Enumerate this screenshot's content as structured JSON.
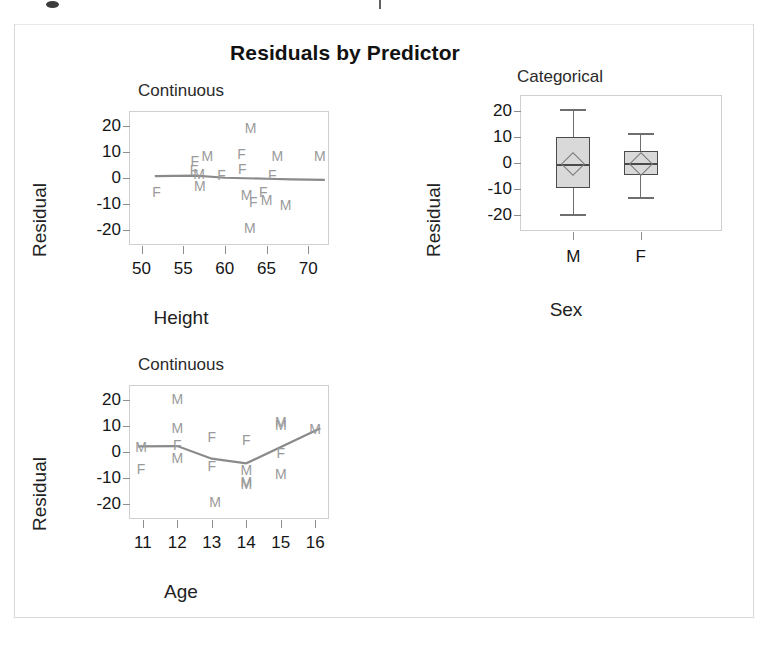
{
  "figure": {
    "title": "Residuals by Predictor",
    "background_color": "#ffffff",
    "frame_color": "#d8d8d8",
    "point_color": "#9a9a9a",
    "line_color": "#8a8a8a",
    "box_fill_color": "#d9d9d9",
    "box_border_color": "#4a4a4a"
  },
  "chart_data": [
    {
      "type": "scatter",
      "panel_index": 0,
      "title": "Continuous",
      "xlabel": "Height",
      "ylabel": "Residual",
      "xlim": [
        48.5,
        72.5
      ],
      "ylim": [
        -26,
        26
      ],
      "xticks": [
        50,
        55,
        60,
        65,
        70
      ],
      "yticks": [
        20,
        10,
        0,
        -10,
        -20
      ],
      "grid": false,
      "legend": "none",
      "point_labels": [
        "M",
        "F"
      ],
      "points": [
        {
          "x": 51.8,
          "y": -5.5,
          "label": "F"
        },
        {
          "x": 56.4,
          "y": 6.5,
          "label": "F"
        },
        {
          "x": 56.3,
          "y": 3.0,
          "label": "F"
        },
        {
          "x": 56.9,
          "y": 1.5,
          "label": "M"
        },
        {
          "x": 57.0,
          "y": -3.0,
          "label": "M"
        },
        {
          "x": 57.9,
          "y": 8.5,
          "label": "M"
        },
        {
          "x": 59.6,
          "y": 1.0,
          "label": "F"
        },
        {
          "x": 62.0,
          "y": 9.5,
          "label": "F"
        },
        {
          "x": 62.1,
          "y": 3.5,
          "label": "F"
        },
        {
          "x": 63.1,
          "y": 19.5,
          "label": "M"
        },
        {
          "x": 62.6,
          "y": -6.5,
          "label": "M"
        },
        {
          "x": 63.4,
          "y": -9.5,
          "label": "F"
        },
        {
          "x": 63.0,
          "y": -19.5,
          "label": "M"
        },
        {
          "x": 64.6,
          "y": -5.5,
          "label": "F"
        },
        {
          "x": 65.7,
          "y": 1.0,
          "label": "F"
        },
        {
          "x": 65.0,
          "y": -8.5,
          "label": "M"
        },
        {
          "x": 66.3,
          "y": 8.5,
          "label": "M"
        },
        {
          "x": 67.3,
          "y": -10.5,
          "label": "M"
        },
        {
          "x": 71.4,
          "y": 8.5,
          "label": "M"
        }
      ],
      "fit_line": [
        {
          "x": 51.6,
          "y": 0.7
        },
        {
          "x": 56.5,
          "y": 0.9
        },
        {
          "x": 60.0,
          "y": 0.1
        },
        {
          "x": 65.0,
          "y": -0.3
        },
        {
          "x": 68.0,
          "y": -0.5
        },
        {
          "x": 72.0,
          "y": -0.7
        }
      ]
    },
    {
      "type": "box",
      "panel_index": 1,
      "title": "Categorical",
      "xlabel": "Sex",
      "ylabel": "Residual",
      "ylim": [
        -26,
        26
      ],
      "yticks": [
        20,
        10,
        0,
        -10,
        -20
      ],
      "grid": false,
      "legend": "none",
      "categories": [
        "M",
        "F"
      ],
      "boxes": [
        {
          "category": "M",
          "whisker_low": -19.5,
          "q1": -9.5,
          "median": -0.5,
          "q3": 10.0,
          "whisker_high": 20.5,
          "mean": -0.5
        },
        {
          "category": "F",
          "whisker_low": -13.0,
          "q1": -4.5,
          "median": 0.0,
          "q3": 4.5,
          "whisker_high": 11.5,
          "mean": -0.5
        }
      ]
    },
    {
      "type": "scatter",
      "panel_index": 2,
      "title": "Continuous",
      "xlabel": "Age",
      "ylabel": "Residual",
      "xlim": [
        10.6,
        16.4
      ],
      "ylim": [
        -26,
        26
      ],
      "xticks": [
        11,
        12,
        13,
        14,
        15,
        16
      ],
      "yticks": [
        20,
        10,
        0,
        -10,
        -20
      ],
      "grid": false,
      "legend": "none",
      "point_labels": [
        "M",
        "F"
      ],
      "points": [
        {
          "x": 10.95,
          "y": 2.0,
          "label": "M"
        },
        {
          "x": 10.95,
          "y": -6.5,
          "label": "F"
        },
        {
          "x": 12.0,
          "y": 20.5,
          "label": "M"
        },
        {
          "x": 12.0,
          "y": 9.5,
          "label": "M"
        },
        {
          "x": 12.0,
          "y": 2.6,
          "label": "F"
        },
        {
          "x": 12.0,
          "y": -2.5,
          "label": "M"
        },
        {
          "x": 13.0,
          "y": 6.0,
          "label": "F"
        },
        {
          "x": 13.0,
          "y": -5.5,
          "label": "F"
        },
        {
          "x": 13.1,
          "y": -19.5,
          "label": "M"
        },
        {
          "x": 14.0,
          "y": 4.5,
          "label": "F"
        },
        {
          "x": 14.0,
          "y": -7.0,
          "label": "M"
        },
        {
          "x": 14.0,
          "y": -11.5,
          "label": "M"
        },
        {
          "x": 14.0,
          "y": -12.5,
          "label": "M"
        },
        {
          "x": 15.0,
          "y": 11.5,
          "label": "M"
        },
        {
          "x": 15.0,
          "y": 10.5,
          "label": "M"
        },
        {
          "x": 15.0,
          "y": -0.5,
          "label": "F"
        },
        {
          "x": 15.0,
          "y": -8.5,
          "label": "M"
        },
        {
          "x": 16.0,
          "y": 9.0,
          "label": "M"
        }
      ],
      "fit_line": [
        {
          "x": 10.85,
          "y": 2.2
        },
        {
          "x": 12.0,
          "y": 2.3
        },
        {
          "x": 13.0,
          "y": -2.6
        },
        {
          "x": 14.0,
          "y": -4.4
        },
        {
          "x": 16.15,
          "y": 9.2
        }
      ]
    }
  ]
}
